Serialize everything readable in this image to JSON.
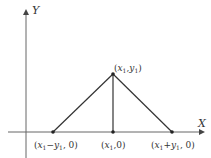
{
  "diagram": {
    "axes": {
      "x_label": "X",
      "y_label": "Y"
    },
    "points": {
      "apex": {
        "label_var": "x",
        "label_sub": "1",
        "label_var2": "y",
        "label_sub2": "1",
        "text": "(x1, y1)"
      },
      "left": {
        "text": "(x1 − y1, 0)"
      },
      "middle": {
        "text": "(x1, 0)"
      },
      "right": {
        "text": "(x1 + y1, 0)"
      }
    },
    "colors": {
      "line": "#333333",
      "axis": "#555555"
    }
  }
}
